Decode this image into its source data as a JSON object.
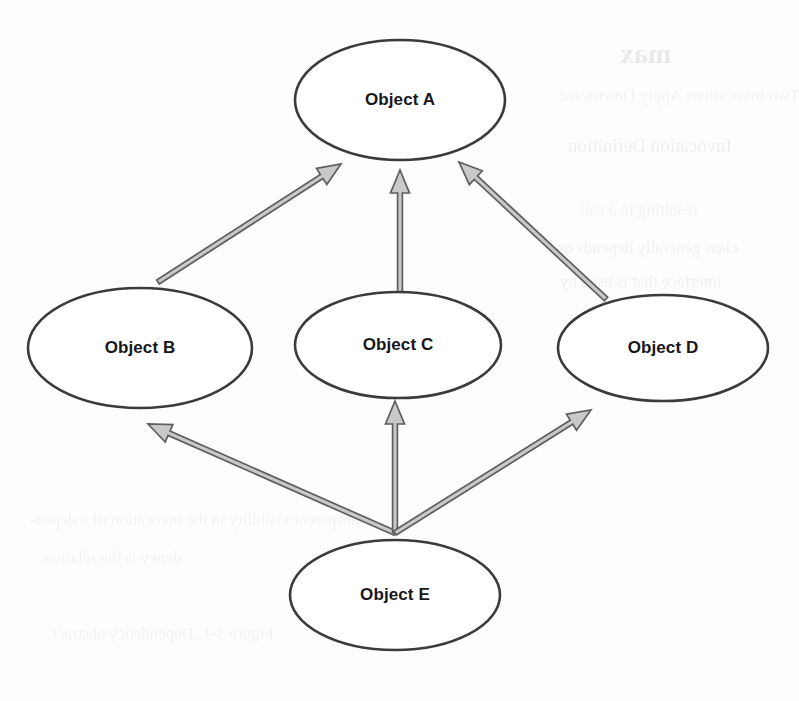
{
  "page": {
    "width": 799,
    "height": 701,
    "background_color": "#fdfdfd"
  },
  "style": {
    "node_fill": "#ffffff",
    "node_stroke": "#3a3a3c",
    "arrow_fill": "#c9c9c9",
    "arrow_stroke": "#5e5e62",
    "label_color": "#17171a"
  },
  "diagram": {
    "type": "object-dependency-graph",
    "node_shape": "ellipse",
    "arrow_style": "hollow-block-arrow",
    "nodes": [
      {
        "id": "A",
        "label": "Object A",
        "cx": 400,
        "cy": 100,
        "rx": 105,
        "ry": 60
      },
      {
        "id": "B",
        "label": "Object B",
        "cx": 140,
        "cy": 348,
        "rx": 112,
        "ry": 60
      },
      {
        "id": "C",
        "label": "Object C",
        "cx": 398,
        "cy": 345,
        "rx": 103,
        "ry": 53
      },
      {
        "id": "D",
        "label": "Object D",
        "cx": 663,
        "cy": 348,
        "rx": 105,
        "ry": 53
      },
      {
        "id": "E",
        "label": "Object E",
        "cx": 395,
        "cy": 595,
        "rx": 105,
        "ry": 55
      }
    ],
    "edges": [
      {
        "id": "b-to-a",
        "from": "B",
        "to": "A",
        "label": "",
        "x1": 158,
        "y1": 282,
        "x2": 341,
        "y2": 164
      },
      {
        "id": "c-to-a",
        "from": "C",
        "to": "A",
        "label": "",
        "x1": 400,
        "y1": 293,
        "x2": 400,
        "y2": 170
      },
      {
        "id": "d-to-a",
        "from": "D",
        "to": "A",
        "label": "",
        "x1": 606,
        "y1": 299,
        "x2": 459,
        "y2": 162
      },
      {
        "id": "e-to-b",
        "from": "E",
        "to": "B",
        "label": "",
        "x1": 395,
        "y1": 533,
        "x2": 148,
        "y2": 424
      },
      {
        "id": "e-to-c",
        "from": "E",
        "to": "C",
        "label": "",
        "x1": 395,
        "y1": 533,
        "x2": 395,
        "y2": 401
      },
      {
        "id": "e-to-d",
        "from": "E",
        "to": "D",
        "label": "",
        "x1": 395,
        "y1": 533,
        "x2": 591,
        "y2": 410
      }
    ]
  },
  "ghost_text": {
    "note": "faint mirrored bleed-through from the reverse side of the scanned page",
    "lines": [
      {
        "id": "g1",
        "text": "max",
        "x": 620,
        "y": 38,
        "size": 28,
        "weight": "heavy"
      },
      {
        "id": "g2",
        "text": "Two Invocations Apply Downward",
        "x": 560,
        "y": 86,
        "size": 17,
        "weight": "light"
      },
      {
        "id": "g3",
        "text": "Invocation Definition",
        "x": 568,
        "y": 135,
        "size": 19,
        "weight": "normal"
      },
      {
        "id": "g4",
        "text": "resulting in a call",
        "x": 580,
        "y": 200,
        "size": 17,
        "weight": "light"
      },
      {
        "id": "g5",
        "text": "class generally depends on",
        "x": 556,
        "y": 238,
        "size": 17,
        "weight": "normal"
      },
      {
        "id": "g6",
        "text": "interface that is used by",
        "x": 560,
        "y": 272,
        "size": 17,
        "weight": "normal"
      },
      {
        "id": "g7",
        "text": "Transparent visibility in the invocation of a depen-",
        "x": 30,
        "y": 510,
        "size": 17,
        "weight": "light"
      },
      {
        "id": "g8",
        "text": "dency is the relation",
        "x": 44,
        "y": 548,
        "size": 17,
        "weight": "light"
      },
      {
        "id": "g9",
        "text": "Figure 3-1. Dependency abstract",
        "x": 52,
        "y": 624,
        "size": 17,
        "weight": "light"
      }
    ]
  }
}
